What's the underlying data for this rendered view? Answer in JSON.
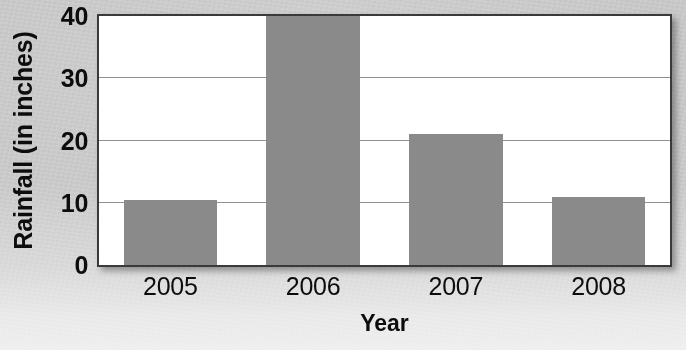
{
  "chart_data": {
    "type": "bar",
    "title": "",
    "xlabel": "Year",
    "ylabel": "Rainfall (in inches)",
    "categories": [
      "2005",
      "2006",
      "2007",
      "2008"
    ],
    "values": [
      10.5,
      41.5,
      21,
      11
    ],
    "ylim": [
      0,
      40
    ],
    "yticks": [
      0,
      10,
      20,
      30,
      40
    ],
    "ytick_labels": [
      "0",
      "10",
      "20",
      "30",
      "40"
    ],
    "grid": "horizontal",
    "legend": "none",
    "bar_color": "#8a8a8a",
    "plot_background": "#ffffff",
    "plot_border_color": "#3a3a3a",
    "gridline_color": "#8f8f8f",
    "text_color": "#0d0d0d",
    "page_background": "#c8c8c8"
  }
}
